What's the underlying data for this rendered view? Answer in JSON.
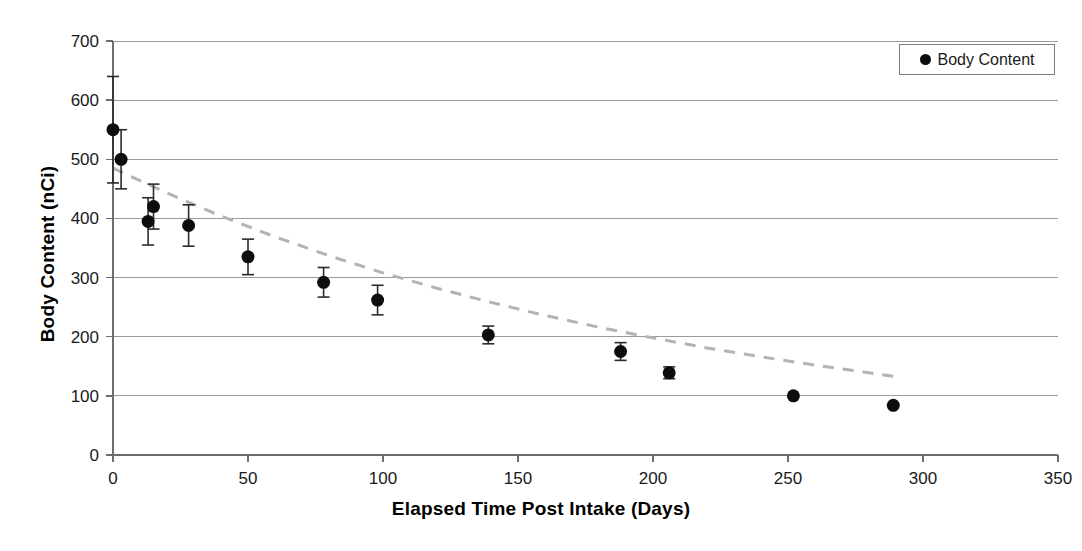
{
  "chart_data": {
    "type": "scatter",
    "title": "",
    "xlabel": "Elapsed Time Post Intake (Days)",
    "ylabel": "Body Content (nCi)",
    "xlim": [
      0,
      350
    ],
    "ylim": [
      0,
      700
    ],
    "xticks": [
      0,
      50,
      100,
      150,
      200,
      250,
      300,
      350
    ],
    "yticks": [
      0,
      100,
      200,
      300,
      400,
      500,
      600,
      700
    ],
    "grid": "horizontal",
    "legend": {
      "position": "top-right",
      "entries": [
        "Body Content"
      ]
    },
    "marker": {
      "shape": "circle",
      "color": "#0d0d0d",
      "size": 13
    },
    "series": [
      {
        "name": "Body Content",
        "x": [
          0,
          3,
          13,
          15,
          28,
          50,
          78,
          98,
          139,
          188,
          206,
          252,
          289
        ],
        "y": [
          550,
          500,
          395,
          420,
          388,
          335,
          292,
          262,
          203,
          175,
          139,
          100,
          84
        ],
        "yerr": [
          90,
          50,
          40,
          38,
          35,
          30,
          25,
          25,
          15,
          15,
          10,
          0,
          0
        ]
      }
    ],
    "trendline": {
      "style": "dashed",
      "color": "#b3b3b3",
      "x": [
        0,
        20,
        40,
        60,
        80,
        100,
        120,
        140,
        160,
        180,
        200,
        220,
        240,
        260,
        280,
        292
      ],
      "y": [
        485,
        443,
        404,
        369,
        337,
        308,
        282,
        258,
        236,
        216,
        198,
        181,
        166,
        152,
        139,
        131
      ]
    }
  },
  "legend": {
    "entry_label": "Body Content",
    "marker_icon": "filled-circle-marker-icon"
  },
  "axes": {
    "x_title": "Elapsed Time Post Intake (Days)",
    "y_title": "Body Content (nCi)",
    "x_tick_labels": [
      "0",
      "50",
      "100",
      "150",
      "200",
      "250",
      "300",
      "350"
    ],
    "y_tick_labels": [
      "0",
      "100",
      "200",
      "300",
      "400",
      "500",
      "600",
      "700"
    ]
  },
  "colors": {
    "marker": "#0d0d0d",
    "trendline": "#b3b3b3",
    "gridline": "#9a9a9a",
    "axis": "#6e6e6e",
    "text": "#1a1a1a"
  }
}
